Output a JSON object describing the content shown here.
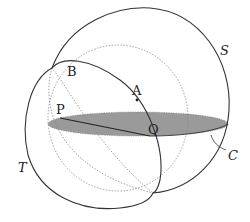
{
  "diagram": {
    "labels": {
      "S": "S",
      "T": "T",
      "C": "C",
      "A": "A",
      "B": "B",
      "P": "P",
      "Q": "Q"
    },
    "colors": {
      "stroke": "#333333",
      "dotted": "#8a8a8a",
      "shaded_disc": "#9a9a9a",
      "background": "#ffffff"
    },
    "elements": [
      {
        "id": "S",
        "type": "sphere-outline",
        "style": "solid"
      },
      {
        "id": "T",
        "type": "sphere-outline",
        "style": "solid"
      },
      {
        "id": "C",
        "type": "shaded-disc",
        "style": "filled-ellipse"
      },
      {
        "id": "PQ",
        "type": "segment",
        "from": "P",
        "to": "Q"
      },
      {
        "id": "A",
        "type": "point"
      },
      {
        "id": "B",
        "type": "point-label"
      },
      {
        "id": "intersection-circle",
        "type": "great-circle",
        "style": "solid"
      },
      {
        "id": "hidden-arcs",
        "type": "hidden-lines",
        "style": "dotted"
      }
    ]
  }
}
